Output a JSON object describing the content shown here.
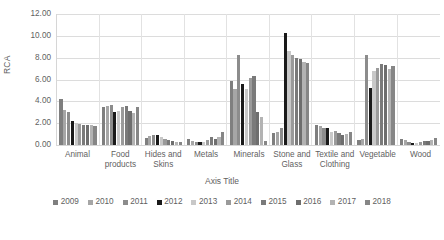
{
  "chart_data": {
    "type": "bar",
    "title": "",
    "xlabel": "Axis Title",
    "ylabel": "RCA",
    "ylim": [
      0,
      12
    ],
    "ytick_step": 2,
    "ytick_labels": [
      "0.00",
      "2.00",
      "4.00",
      "6.00",
      "8.00",
      "10.00",
      "12.00"
    ],
    "grid": true,
    "legend_position": "bottom",
    "categories": [
      "Animal",
      "Food products",
      "Hides and Skins",
      "Metals",
      "Minerals",
      "Stone and Glass",
      "Textile and Clothing",
      "Vegetable",
      "Wood"
    ],
    "series": [
      {
        "name": "2009",
        "color": "#7f7f7f",
        "values": [
          4.2,
          3.45,
          0.65,
          0.55,
          5.9,
          1.1,
          1.85,
          0.5,
          0.55
        ]
      },
      {
        "name": "2010",
        "color": "#a6a6a6",
        "values": [
          3.25,
          3.6,
          0.85,
          0.35,
          5.1,
          1.2,
          1.75,
          0.55,
          0.45
        ]
      },
      {
        "name": "2011",
        "color": "#8c8c8c",
        "values": [
          3.05,
          3.7,
          0.9,
          0.3,
          8.2,
          1.6,
          1.6,
          8.2,
          0.25
        ]
      },
      {
        "name": "2012",
        "color": "#1a1a1a",
        "values": [
          2.2,
          3.05,
          0.95,
          0.25,
          5.6,
          10.3,
          1.55,
          5.2,
          0.2
        ]
      },
      {
        "name": "2013",
        "color": "#c8c8c8",
        "values": [
          2.0,
          3.1,
          0.75,
          0.3,
          5.1,
          8.6,
          1.15,
          6.8,
          0.15
        ]
      },
      {
        "name": "2014",
        "color": "#9a9a9a",
        "values": [
          1.95,
          3.5,
          0.55,
          0.45,
          6.1,
          8.2,
          1.25,
          7.1,
          0.3
        ]
      },
      {
        "name": "2015",
        "color": "#7a7a7a",
        "values": [
          1.8,
          3.55,
          0.45,
          0.7,
          6.3,
          8.0,
          1.1,
          7.4,
          0.4
        ]
      },
      {
        "name": "2016",
        "color": "#6e6e6e",
        "values": [
          1.85,
          3.15,
          0.35,
          0.55,
          3.0,
          7.9,
          0.95,
          7.3,
          0.35
        ]
      },
      {
        "name": "2017",
        "color": "#b3b3b3",
        "values": [
          1.8,
          2.9,
          0.3,
          0.75,
          2.6,
          7.6,
          1.05,
          7.0,
          0.45
        ]
      },
      {
        "name": "2018",
        "color": "#868686",
        "values": [
          1.75,
          3.45,
          0.25,
          1.2,
          0.35,
          7.5,
          1.2,
          7.2,
          0.6
        ]
      }
    ]
  }
}
